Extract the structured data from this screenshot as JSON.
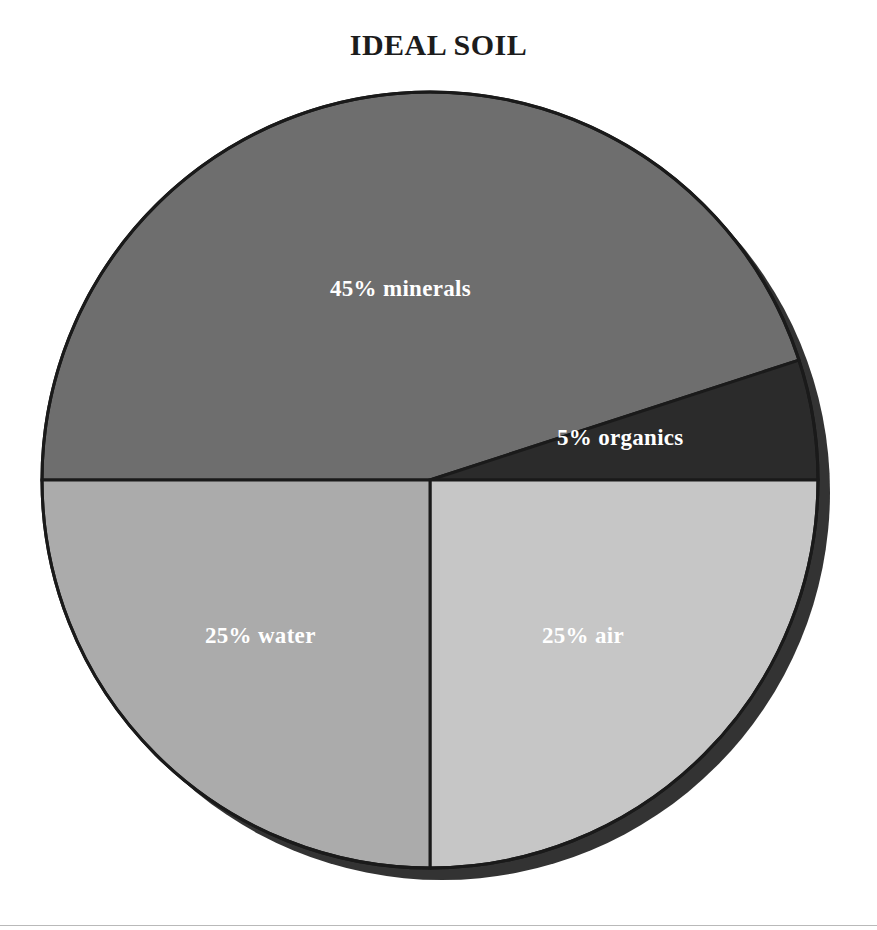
{
  "title": "IDEAL SOIL",
  "chart_data": {
    "type": "pie",
    "title": "IDEAL SOIL",
    "xlabel": "",
    "ylabel": "",
    "legend": "none",
    "grid": false,
    "labels_inside_slices": true,
    "start_angle_deg": 180,
    "direction": "clockwise",
    "categories": [
      "minerals",
      "organics",
      "air",
      "water"
    ],
    "values": [
      45,
      5,
      25,
      25
    ],
    "unit": "%",
    "slices": [
      {
        "name": "minerals",
        "label": "45% minerals",
        "value": 45,
        "color": "#6e6e6e",
        "start_deg": 180,
        "end_deg": 342
      },
      {
        "name": "organics",
        "label": "5% organics",
        "value": 5,
        "color": "#2b2b2b",
        "start_deg": 342,
        "end_deg": 360
      },
      {
        "name": "air",
        "label": "25% air",
        "value": 25,
        "color": "#c6c6c6",
        "start_deg": 0,
        "end_deg": 90
      },
      {
        "name": "water",
        "label": "25% water",
        "value": 25,
        "color": "#ababab",
        "start_deg": 90,
        "end_deg": 180
      }
    ]
  },
  "style": {
    "background": "#ffffff",
    "outline_color": "#1a1a1a",
    "shadow_color": "#333333",
    "label_text_color": "#ffffff",
    "title_color": "#1c1c1c",
    "rule_color": "#b9b9b9"
  }
}
